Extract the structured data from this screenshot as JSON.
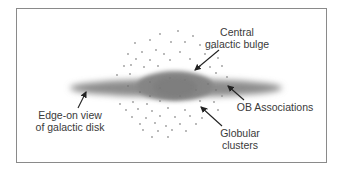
{
  "diagram": {
    "labels": {
      "bulge": [
        "Central",
        "galactic bulge"
      ],
      "ob": [
        "OB Associations"
      ],
      "disk": [
        "Edge-on view",
        "of galactic disk"
      ],
      "globular": [
        "Globular",
        "clusters"
      ]
    },
    "colors": {
      "disk": "#8c8c8c",
      "dots": "#9a9a9a",
      "arrow": "#222222",
      "frame": "#8a8a8a",
      "text": "#3a3a3a"
    }
  }
}
